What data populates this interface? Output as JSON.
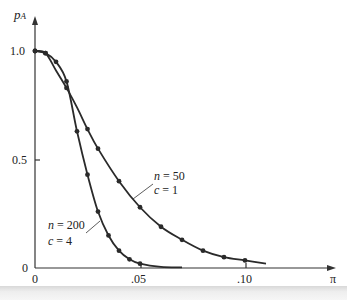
{
  "chart_data": {
    "type": "line",
    "title": "",
    "xlabel": "π",
    "ylabel": "p_A",
    "xlim": [
      0,
      0.12
    ],
    "ylim": [
      0,
      1.1
    ],
    "grid": false,
    "legend": "inline annotations",
    "x_ticks": [
      "0",
      ".05",
      ".10"
    ],
    "y_ticks": [
      "0",
      "0.5",
      "1.0"
    ],
    "series": [
      {
        "name": "n = 50, c = 1",
        "x": [
          0,
          0.005,
          0.01,
          0.015,
          0.02,
          0.025,
          0.03,
          0.04,
          0.05,
          0.06,
          0.07,
          0.08,
          0.09,
          0.1,
          0.11
        ],
        "y": [
          1.0,
          0.99,
          0.91,
          0.83,
          0.74,
          0.64,
          0.55,
          0.4,
          0.28,
          0.19,
          0.13,
          0.08,
          0.05,
          0.035,
          0.02
        ]
      },
      {
        "name": "n = 200, c = 4",
        "x": [
          0,
          0.005,
          0.01,
          0.015,
          0.02,
          0.025,
          0.03,
          0.035,
          0.04,
          0.045,
          0.05,
          0.06,
          0.07
        ],
        "y": [
          1.0,
          0.99,
          0.95,
          0.86,
          0.63,
          0.43,
          0.26,
          0.15,
          0.08,
          0.04,
          0.02,
          0.005,
          0.003
        ]
      }
    ],
    "annotations": [
      {
        "line1": "n = 50",
        "line2": "c = 1"
      },
      {
        "line1": "n = 200",
        "line2": "c = 4"
      }
    ]
  },
  "labels": {
    "ylabel_main": "p",
    "ylabel_sub": "A",
    "xlabel": "π",
    "y_1": "1.0",
    "y_05": "0.5",
    "y_0": "0",
    "x_0": "0",
    "x_05": ".05",
    "x_10": ".10",
    "ann1_n": "n",
    "ann1_nval": " = 50",
    "ann1_c": "c",
    "ann1_cval": " = 1",
    "ann2_n": "n",
    "ann2_nval": " = 200",
    "ann2_c": "c",
    "ann2_cval": " = 4"
  }
}
